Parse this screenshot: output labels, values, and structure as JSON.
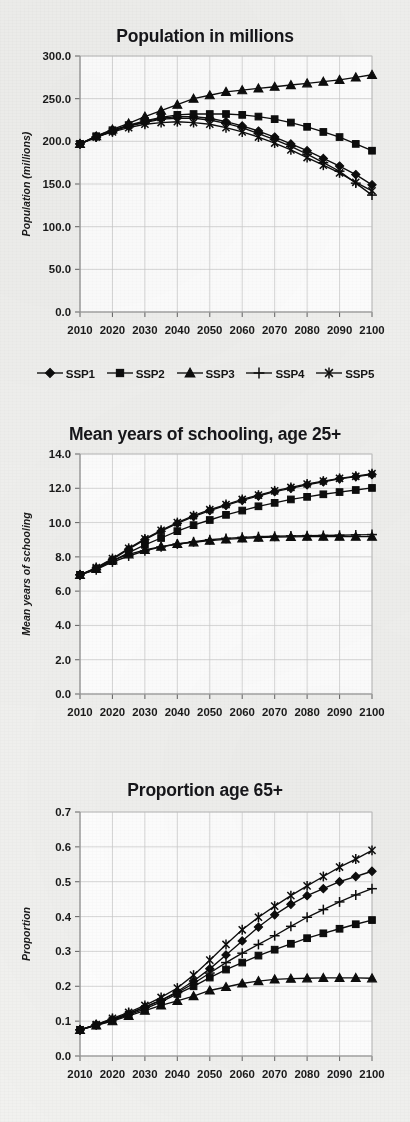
{
  "figure": {
    "background_color": "#f1f1ef",
    "ink_color": "#0d0d0d",
    "grid_color": "#c9c9c9"
  },
  "legend": {
    "position": "below-first-chart",
    "entries": [
      {
        "label": "SSP1",
        "marker": "diamond-icon"
      },
      {
        "label": "SSP2",
        "marker": "square-icon"
      },
      {
        "label": "SSP3",
        "marker": "triangle-icon"
      },
      {
        "label": "SSP4",
        "marker": "plus-icon"
      },
      {
        "label": "SSP5",
        "marker": "asterisk-icon"
      }
    ]
  },
  "chart_data": [
    {
      "id": "population",
      "type": "line",
      "title": "Population in millions",
      "xlabel": "",
      "ylabel": "Population (millions)",
      "x": [
        2010,
        2015,
        2020,
        2025,
        2030,
        2035,
        2040,
        2045,
        2050,
        2055,
        2060,
        2065,
        2070,
        2075,
        2080,
        2085,
        2090,
        2095,
        2100
      ],
      "xticks": [
        2010,
        2020,
        2030,
        2040,
        2050,
        2060,
        2070,
        2080,
        2090,
        2100
      ],
      "xlim": [
        2010,
        2100
      ],
      "ylim": [
        0.0,
        300.0
      ],
      "yticks": [
        "0.0",
        "50.0",
        "100.0",
        "150.0",
        "200.0",
        "250.0",
        "300.0"
      ],
      "grid": true,
      "series": [
        {
          "name": "SSP1",
          "marker": "diamond",
          "values": [
            197,
            205,
            212,
            218,
            223,
            227,
            229,
            229,
            227,
            223,
            218,
            212,
            205,
            197,
            189,
            180,
            171,
            161,
            149
          ]
        },
        {
          "name": "SSP2",
          "marker": "square",
          "values": [
            197,
            206,
            213,
            219,
            224,
            228,
            231,
            232,
            232,
            232,
            231,
            229,
            226,
            222,
            217,
            211,
            205,
            197,
            189
          ]
        },
        {
          "name": "SSP3",
          "marker": "triangle",
          "values": [
            197,
            206,
            214,
            221,
            229,
            236,
            243,
            250,
            254,
            258,
            260,
            262,
            264,
            266,
            268,
            270,
            272,
            275,
            278
          ]
        },
        {
          "name": "SSP4",
          "marker": "plus",
          "values": [
            197,
            205,
            212,
            218,
            222,
            226,
            227,
            227,
            225,
            221,
            216,
            209,
            202,
            194,
            185,
            175,
            165,
            151,
            137
          ]
        },
        {
          "name": "SSP5",
          "marker": "asterisk",
          "values": [
            197,
            205,
            211,
            216,
            220,
            222,
            223,
            222,
            220,
            216,
            211,
            205,
            198,
            190,
            181,
            172,
            163,
            152,
            142
          ]
        }
      ]
    },
    {
      "id": "schooling",
      "type": "line",
      "title": "Mean years of schooling, age 25+",
      "xlabel": "",
      "ylabel": "Mean years of schooling",
      "x": [
        2010,
        2015,
        2020,
        2025,
        2030,
        2035,
        2040,
        2045,
        2050,
        2055,
        2060,
        2065,
        2070,
        2075,
        2080,
        2085,
        2090,
        2095,
        2100
      ],
      "xticks": [
        2010,
        2020,
        2030,
        2040,
        2050,
        2060,
        2070,
        2080,
        2090,
        2100
      ],
      "xlim": [
        2010,
        2100
      ],
      "ylim": [
        0.0,
        14.0
      ],
      "yticks": [
        "0.0",
        "2.0",
        "4.0",
        "6.0",
        "8.0",
        "10.0",
        "12.0",
        "14.0"
      ],
      "grid": true,
      "series": [
        {
          "name": "SSP1",
          "marker": "diamond",
          "values": [
            6.95,
            7.35,
            7.85,
            8.45,
            9.0,
            9.5,
            9.95,
            10.35,
            10.7,
            11.0,
            11.3,
            11.55,
            11.8,
            12.0,
            12.2,
            12.38,
            12.55,
            12.68,
            12.8
          ]
        },
        {
          "name": "SSP2",
          "marker": "square",
          "values": [
            6.95,
            7.3,
            7.75,
            8.25,
            8.7,
            9.1,
            9.5,
            9.85,
            10.15,
            10.45,
            10.7,
            10.95,
            11.15,
            11.35,
            11.5,
            11.65,
            11.78,
            11.9,
            12.02
          ]
        },
        {
          "name": "SSP3",
          "marker": "triangle",
          "values": [
            6.95,
            7.3,
            7.8,
            8.15,
            8.4,
            8.6,
            8.75,
            8.85,
            8.95,
            9.02,
            9.08,
            9.12,
            9.15,
            9.17,
            9.18,
            9.18,
            9.18,
            9.18,
            9.18
          ]
        },
        {
          "name": "SSP4",
          "marker": "plus",
          "values": [
            6.95,
            7.25,
            7.7,
            8.05,
            8.35,
            8.58,
            8.75,
            8.88,
            9.0,
            9.08,
            9.14,
            9.18,
            9.2,
            9.22,
            9.24,
            9.25,
            9.26,
            9.28,
            9.3
          ]
        },
        {
          "name": "SSP5",
          "marker": "asterisk",
          "values": [
            6.95,
            7.38,
            7.9,
            8.5,
            9.05,
            9.55,
            10.0,
            10.4,
            10.75,
            11.05,
            11.35,
            11.6,
            11.85,
            12.05,
            12.25,
            12.42,
            12.58,
            12.7,
            12.85
          ]
        }
      ]
    },
    {
      "id": "proportion65",
      "type": "line",
      "title": "Proportion age 65+",
      "xlabel": "",
      "ylabel": "Proportion",
      "x": [
        2010,
        2015,
        2020,
        2025,
        2030,
        2035,
        2040,
        2045,
        2050,
        2055,
        2060,
        2065,
        2070,
        2075,
        2080,
        2085,
        2090,
        2095,
        2100
      ],
      "xticks": [
        2010,
        2020,
        2030,
        2040,
        2050,
        2060,
        2070,
        2080,
        2090,
        2100
      ],
      "xlim": [
        2010,
        2100
      ],
      "ylim": [
        0.0,
        0.7
      ],
      "yticks": [
        "0.0",
        "0.1",
        "0.2",
        "0.3",
        "0.4",
        "0.5",
        "0.6",
        "0.7"
      ],
      "grid": true,
      "series": [
        {
          "name": "SSP1",
          "marker": "diamond",
          "values": [
            0.075,
            0.09,
            0.105,
            0.12,
            0.14,
            0.16,
            0.185,
            0.215,
            0.25,
            0.29,
            0.33,
            0.37,
            0.405,
            0.435,
            0.46,
            0.48,
            0.5,
            0.515,
            0.53
          ]
        },
        {
          "name": "SSP2",
          "marker": "square",
          "values": [
            0.075,
            0.088,
            0.102,
            0.118,
            0.135,
            0.155,
            0.178,
            0.2,
            0.225,
            0.248,
            0.268,
            0.288,
            0.305,
            0.322,
            0.338,
            0.352,
            0.365,
            0.378,
            0.39
          ]
        },
        {
          "name": "SSP3",
          "marker": "triangle",
          "values": [
            0.075,
            0.088,
            0.1,
            0.115,
            0.13,
            0.145,
            0.158,
            0.172,
            0.188,
            0.198,
            0.208,
            0.215,
            0.22,
            0.222,
            0.223,
            0.224,
            0.224,
            0.224,
            0.223
          ]
        },
        {
          "name": "SSP4",
          "marker": "plus",
          "values": [
            0.075,
            0.09,
            0.105,
            0.122,
            0.14,
            0.16,
            0.182,
            0.208,
            0.238,
            0.268,
            0.295,
            0.32,
            0.345,
            0.372,
            0.398,
            0.42,
            0.442,
            0.462,
            0.48
          ]
        },
        {
          "name": "SSP5",
          "marker": "asterisk",
          "values": [
            0.075,
            0.09,
            0.108,
            0.125,
            0.145,
            0.168,
            0.195,
            0.232,
            0.275,
            0.32,
            0.362,
            0.398,
            0.43,
            0.46,
            0.488,
            0.515,
            0.542,
            0.565,
            0.59
          ]
        }
      ]
    }
  ]
}
